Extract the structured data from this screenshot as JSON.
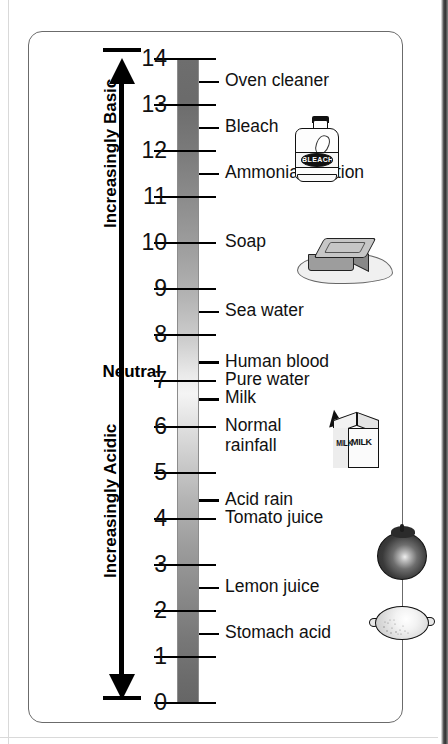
{
  "figure": {
    "axis_labels": {
      "basic": "Increasingly Basic",
      "neutral": "Neutral",
      "acidic": "Increasingly Acidic"
    }
  },
  "chart_data": {
    "type": "scatter",
    "ylabel": "pH",
    "ylim": [
      0,
      14
    ],
    "grid": false,
    "legend": "none",
    "orientation": "vertical",
    "axis_direction": "0 at bottom, 14 at top",
    "tick_labels": [
      "14",
      "13",
      "12",
      "11",
      "10",
      "9",
      "8",
      "7",
      "6",
      "5",
      "4",
      "3",
      "2",
      "1",
      "0"
    ],
    "tick_values": [
      14,
      13,
      12,
      11,
      10,
      9,
      8,
      7,
      6,
      5,
      4,
      3,
      2,
      1,
      0
    ],
    "annotations": [
      {
        "label": "Increasingly Basic",
        "range": [
          7,
          14
        ]
      },
      {
        "label": "Neutral",
        "value": 7
      },
      {
        "label": "Increasingly Acidic",
        "range": [
          0,
          7
        ]
      }
    ],
    "categories": [
      "Oven cleaner",
      "Bleach",
      "Ammonia solution",
      "Soap",
      "Sea water",
      "Human blood",
      "Pure water",
      "Milk",
      "Normal rainfall",
      "Acid rain",
      "Tomato juice",
      "Lemon juice",
      "Stomach acid"
    ],
    "values": [
      13.5,
      12.5,
      11.5,
      10,
      8.5,
      7.4,
      7,
      6.6,
      6,
      4.4,
      4,
      2.5,
      1.5
    ],
    "gradient": {
      "top_color": "#6e6e6e",
      "mid_color": "#f4f4f4",
      "bottom_color": "#666666",
      "note": "dark at pH 14, lightest near pH 7, dark at pH 0"
    }
  },
  "scale": {
    "ticks": [
      {
        "label": "14",
        "value": 14
      },
      {
        "label": "13",
        "value": 13
      },
      {
        "label": "12",
        "value": 12
      },
      {
        "label": "11",
        "value": 11
      },
      {
        "label": "10",
        "value": 10
      },
      {
        "label": "9",
        "value": 9
      },
      {
        "label": "8",
        "value": 8
      },
      {
        "label": "7",
        "value": 7
      },
      {
        "label": "6",
        "value": 6
      },
      {
        "label": "5",
        "value": 5
      },
      {
        "label": "4",
        "value": 4
      },
      {
        "label": "3",
        "value": 3
      },
      {
        "label": "2",
        "value": 2
      },
      {
        "label": "1",
        "value": 1
      },
      {
        "label": "0",
        "value": 0
      }
    ],
    "substances": [
      {
        "label": "Oven cleaner",
        "value": 13.5
      },
      {
        "label": "Bleach",
        "value": 12.5
      },
      {
        "label": "Ammonia solution",
        "value": 11.5
      },
      {
        "label": "Soap",
        "value": 10
      },
      {
        "label": "Sea water",
        "value": 8.5
      },
      {
        "label": "Human blood",
        "value": 7.4
      },
      {
        "label": "Pure water",
        "value": 7
      },
      {
        "label": "Milk",
        "value": 6.6
      },
      {
        "label": "Normal\nrainfall",
        "value": 6
      },
      {
        "label": "Acid rain",
        "value": 4.4
      },
      {
        "label": "Tomato juice",
        "value": 4
      },
      {
        "label": "Lemon juice",
        "value": 2.5
      },
      {
        "label": "Stomach acid",
        "value": 1.5
      }
    ]
  },
  "illustrations": {
    "bleach": {
      "name": "bleach-bottle",
      "label_text": "BLEACH"
    },
    "soap": {
      "name": "soap-bar"
    },
    "milk": {
      "name": "milk-carton",
      "label_front": "MILK",
      "label_side": "MILK"
    },
    "tomato": {
      "name": "tomato"
    },
    "lemon": {
      "name": "lemon"
    }
  }
}
